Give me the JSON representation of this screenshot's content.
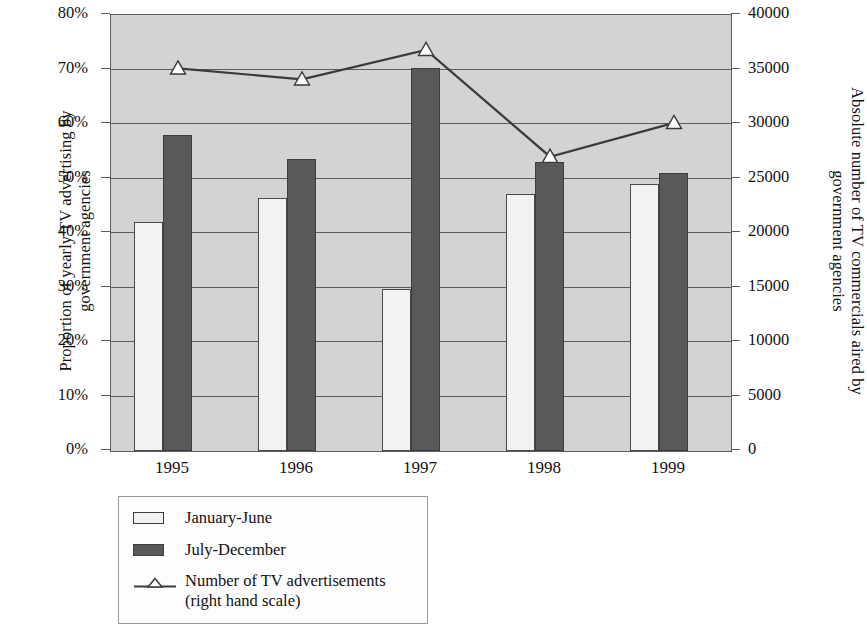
{
  "chart_data": {
    "type": "bar",
    "title": "",
    "subtitle": "",
    "xlabel": "",
    "categories": [
      "1995",
      "1996",
      "1997",
      "1998",
      "1999"
    ],
    "series": [
      {
        "name": "January-June",
        "axis": "left",
        "unit": "%",
        "values": [
          42.0,
          46.5,
          29.8,
          47.2,
          49.0
        ]
      },
      {
        "name": "July-December",
        "axis": "left",
        "unit": "%",
        "values": [
          58.0,
          53.5,
          70.2,
          53.0,
          51.0
        ]
      },
      {
        "name": "Number of TV advertisements",
        "axis": "right",
        "type": "line",
        "unit": "count",
        "values": [
          35100,
          34100,
          36800,
          27000,
          30100
        ]
      }
    ],
    "left_axis": {
      "label_line1": "Proportion of yearly TV advertising by",
      "label_line2": "government agencies",
      "ylim": [
        0,
        80
      ],
      "tick_step": 10,
      "ticks": [
        "0%",
        "10%",
        "20%",
        "30%",
        "40%",
        "50%",
        "60%",
        "70%",
        "80%"
      ]
    },
    "right_axis": {
      "label_line1": "Absolute number of TV commercials aired by",
      "label_line2": "government agencies",
      "ylim": [
        0,
        40000
      ],
      "tick_step": 5000,
      "ticks": [
        "0",
        "5000",
        "10000",
        "15000",
        "20000",
        "25000",
        "30000",
        "35000",
        "40000"
      ]
    },
    "grid": true,
    "legend_position": "below-left",
    "legend": [
      {
        "marker": "bar-light",
        "label": "January-June",
        "sublabel": ""
      },
      {
        "marker": "bar-dark",
        "label": "July-December",
        "sublabel": ""
      },
      {
        "marker": "line-triangle",
        "label": "Number of TV advertisements",
        "sublabel": "(right hand scale)"
      }
    ],
    "colors": {
      "plot_background": "#d3d3d3",
      "bar_light": "#f2f2f2",
      "bar_dark": "#595959",
      "axis": "#5c5c5c",
      "line": "#3a3a3a",
      "marker_fill": "#ffffff"
    }
  }
}
